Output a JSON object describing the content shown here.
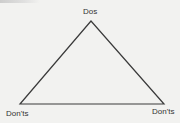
{
  "diagram": {
    "type": "triangle",
    "vertices": {
      "top": {
        "label": "Dos",
        "x": 91,
        "y": 21
      },
      "bottom_left": {
        "label": "Don'ts",
        "x": 20,
        "y": 104
      },
      "bottom_right": {
        "label": "Don'ts",
        "x": 164,
        "y": 104
      }
    },
    "line_color": "#3a3a3a",
    "background": "#f2f2f0"
  }
}
